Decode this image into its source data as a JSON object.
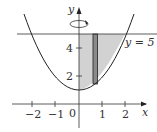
{
  "diagram": {
    "curve": "y = x^2 + 1",
    "line_label": "y = 5",
    "axes": {
      "x_label": "x",
      "y_label": "y",
      "x_ticks": [
        "-2",
        "-1",
        "0",
        "1",
        "2"
      ],
      "y_ticks": [
        "2",
        "4"
      ]
    },
    "rotation_symbol": "rotation-arrow-about-y-axis",
    "colors": {
      "shade": "#d0d0d0",
      "strip": "#8a8a8a",
      "stroke": "#222222"
    }
  }
}
